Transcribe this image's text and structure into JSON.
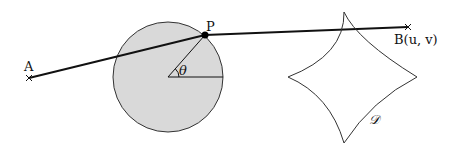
{
  "diagram": {
    "labels": {
      "A": "A",
      "P": "P",
      "theta": "θ",
      "B": "B(u, v)",
      "D": "𝒟"
    },
    "colors": {
      "circle_fill": "#d9d9d9",
      "stroke": "#111111"
    },
    "elements": [
      "line from A to B passing through P on circle",
      "shaded circle with radius to P at angle theta",
      "curved four-pointed region D (astroid-like)"
    ]
  }
}
